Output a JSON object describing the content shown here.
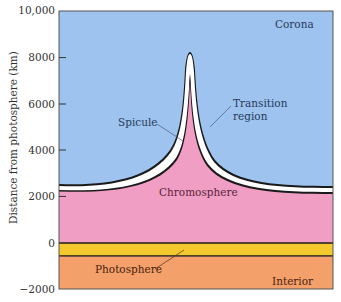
{
  "figure": {
    "y_axis": {
      "title": "Distance from photosphere (km)",
      "ticks": [
        {
          "label": "10,000",
          "value": 10000
        },
        {
          "label": "8000",
          "value": 8000
        },
        {
          "label": "6000",
          "value": 6000
        },
        {
          "label": "4000",
          "value": 4000
        },
        {
          "label": "2000",
          "value": 2000
        },
        {
          "label": "0",
          "value": 0
        },
        {
          "label": "−2000",
          "value": -2000
        }
      ],
      "range": [
        -2000,
        10000
      ]
    },
    "labels": {
      "corona": "Corona",
      "transition_line1": "Transition",
      "transition_line2": "region",
      "spicule": "Spicule",
      "chromosphere": "Chromosphere",
      "photosphere": "Photosphere",
      "interior": "Interior"
    },
    "colors": {
      "corona": "#9DC3EE",
      "chromosphere": "#F19EC4",
      "transition": "#FFFFFF",
      "photosphere": "#F3C92E",
      "interior": "#F3A06A",
      "boundary": "#1a1a1a",
      "text": "#5a1f3a"
    }
  }
}
